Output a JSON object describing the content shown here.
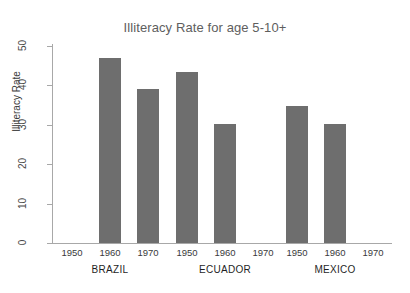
{
  "chart_data": {
    "type": "bar",
    "title": "Illiteracy Rate for age 5-10+",
    "xlabel": "",
    "ylabel": "Illiteracy Rate",
    "ylim": [
      0,
      50
    ],
    "yticks": [
      0,
      10,
      20,
      30,
      40,
      50
    ],
    "ytick_labels": [
      "0",
      "10",
      "20",
      "30",
      "40",
      "50"
    ],
    "grid": false,
    "legend": "none",
    "categories": [
      "1950",
      "1960",
      "1970"
    ],
    "groups": [
      {
        "name": "BRAZIL",
        "points": [
          {
            "x": "1950",
            "y": null
          },
          {
            "x": "1960",
            "y": 47.0
          },
          {
            "x": "1970",
            "y": 39.0
          }
        ]
      },
      {
        "name": "ECUADOR",
        "points": [
          {
            "x": "1950",
            "y": 43.5
          },
          {
            "x": "1960",
            "y": 30.3
          },
          {
            "x": "1970",
            "y": null
          }
        ]
      },
      {
        "name": "MEXICO",
        "points": [
          {
            "x": "1950",
            "y": 34.7
          },
          {
            "x": "1960",
            "y": 30.2
          },
          {
            "x": "1970",
            "y": null
          }
        ]
      }
    ],
    "colors": {
      "bar": "#6e6e6e",
      "axis": "#a8a8a8",
      "title": "#5e5e5e",
      "text": "#3a3a3a",
      "background": "#ffffff"
    }
  },
  "axis": {
    "y_title": "Illiteracy Rate"
  }
}
